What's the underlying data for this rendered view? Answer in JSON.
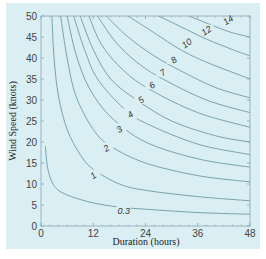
{
  "chart_data": {
    "type": "line",
    "subtype": "contour",
    "title": "",
    "xlabel": "Duration (hours)",
    "ylabel": "Wind Speed (knots)",
    "xlim": [
      0,
      48
    ],
    "ylim": [
      0,
      50
    ],
    "xticks": [
      0,
      12,
      24,
      36,
      48
    ],
    "yticks": [
      0,
      5,
      10,
      15,
      20,
      25,
      30,
      35,
      40,
      45,
      50
    ],
    "grid": false,
    "legend": "none",
    "colors": {
      "background": "#d9eff3",
      "line": "#6f9aa3",
      "axis": "#8aa6ad",
      "text": "#333333"
    },
    "series": [
      {
        "name": "0.3",
        "label_pos": [
          19,
          3.5
        ],
        "points": [
          [
            1,
            19
          ],
          [
            1.5,
            14
          ],
          [
            2.5,
            10.5
          ],
          [
            4,
            8.5
          ],
          [
            7,
            7
          ],
          [
            12,
            5.5
          ],
          [
            18,
            4.5
          ],
          [
            24,
            4
          ],
          [
            36,
            3.2
          ],
          [
            48,
            2.8
          ]
        ]
      },
      {
        "name": "1",
        "label_pos": [
          12,
          12
        ],
        "points": [
          [
            2.5,
            50
          ],
          [
            3,
            40
          ],
          [
            4,
            31
          ],
          [
            6,
            23
          ],
          [
            9,
            17
          ],
          [
            12,
            13.5
          ],
          [
            18,
            10
          ],
          [
            24,
            8.5
          ],
          [
            36,
            7
          ],
          [
            48,
            6
          ]
        ]
      },
      {
        "name": "2",
        "label_pos": [
          15,
          18.5
        ],
        "points": [
          [
            4.5,
            50
          ],
          [
            6,
            40
          ],
          [
            8,
            31
          ],
          [
            12,
            23
          ],
          [
            16,
            19
          ],
          [
            24,
            15
          ],
          [
            36,
            12
          ],
          [
            48,
            10.5
          ]
        ]
      },
      {
        "name": "3",
        "label_pos": [
          18,
          23
        ],
        "points": [
          [
            6,
            50
          ],
          [
            8,
            41
          ],
          [
            11,
            33
          ],
          [
            16,
            26
          ],
          [
            24,
            20
          ],
          [
            36,
            16
          ],
          [
            48,
            14
          ]
        ]
      },
      {
        "name": "4",
        "label_pos": [
          20.5,
          26.5
        ],
        "points": [
          [
            7.5,
            50
          ],
          [
            10,
            42
          ],
          [
            13,
            35
          ],
          [
            19,
            28
          ],
          [
            24,
            24.5
          ],
          [
            36,
            19.5
          ],
          [
            48,
            17
          ]
        ]
      },
      {
        "name": "5",
        "label_pos": [
          23,
          30
        ],
        "points": [
          [
            9,
            50
          ],
          [
            12,
            42
          ],
          [
            16,
            35
          ],
          [
            22,
            30
          ],
          [
            30,
            25
          ],
          [
            40,
            21.5
          ],
          [
            48,
            20
          ]
        ]
      },
      {
        "name": "6",
        "label_pos": [
          25.5,
          33.5
        ],
        "points": [
          [
            11,
            50
          ],
          [
            14,
            43
          ],
          [
            19,
            37
          ],
          [
            25,
            32.5
          ],
          [
            36,
            27
          ],
          [
            48,
            23.5
          ]
        ]
      },
      {
        "name": "7",
        "label_pos": [
          28,
          36.5
        ],
        "points": [
          [
            13,
            50
          ],
          [
            17,
            44
          ],
          [
            22,
            39
          ],
          [
            28,
            35
          ],
          [
            38,
            30
          ],
          [
            48,
            27
          ]
        ]
      },
      {
        "name": "8",
        "label_pos": [
          30.5,
          39.5
        ],
        "points": [
          [
            15,
            50
          ],
          [
            20,
            45
          ],
          [
            26,
            40.5
          ],
          [
            32,
            37
          ],
          [
            40,
            33
          ],
          [
            48,
            30.5
          ]
        ]
      },
      {
        "name": "10",
        "label_pos": [
          33.5,
          43.5
        ],
        "points": [
          [
            20,
            50
          ],
          [
            26,
            46
          ],
          [
            32,
            42
          ],
          [
            38,
            39
          ],
          [
            48,
            35
          ]
        ]
      },
      {
        "name": "12",
        "label_pos": [
          38,
          46.5
        ],
        "points": [
          [
            27,
            50
          ],
          [
            32,
            47.5
          ],
          [
            38,
            44.5
          ],
          [
            44,
            42
          ],
          [
            48,
            40.5
          ]
        ]
      },
      {
        "name": "14",
        "label_pos": [
          43,
          49
        ],
        "points": [
          [
            34,
            50
          ],
          [
            40,
            47.5
          ],
          [
            44,
            46
          ],
          [
            48,
            45
          ]
        ]
      }
    ]
  }
}
